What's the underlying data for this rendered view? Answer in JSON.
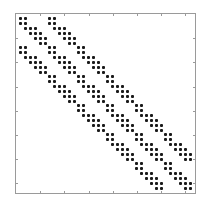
{
  "chart_data": {
    "type": "scatter",
    "subtype": "sparsity-pattern (spy plot)",
    "title": "",
    "xlabel": "",
    "ylabel": "",
    "matrix_size": [
      36,
      36
    ],
    "nnz": 240,
    "xlim": [
      0,
      37
    ],
    "ylim": [
      0,
      37
    ],
    "y_axis_direction": "reversed",
    "tick_step": 5,
    "ticks": [
      5,
      10,
      15,
      20,
      25,
      30,
      35
    ],
    "tick_labels_visible": false,
    "grid": false,
    "legend": null,
    "structure": "block-tridiagonal",
    "block_size": 6,
    "num_blocks": 6,
    "block_pattern_rows": [
      [
        1,
        2
      ],
      [
        1,
        2
      ],
      [
        2,
        3,
        4
      ],
      [
        3,
        4,
        5
      ],
      [
        4,
        5,
        6
      ],
      [
        5,
        6
      ]
    ],
    "blocks": [
      [
        1,
        1
      ],
      [
        1,
        2
      ],
      [
        2,
        1
      ],
      [
        2,
        2
      ],
      [
        2,
        3
      ],
      [
        3,
        2
      ],
      [
        3,
        3
      ],
      [
        3,
        4
      ],
      [
        4,
        3
      ],
      [
        4,
        4
      ],
      [
        4,
        5
      ],
      [
        5,
        4
      ],
      [
        5,
        5
      ],
      [
        5,
        6
      ],
      [
        6,
        5
      ],
      [
        6,
        6
      ]
    ],
    "marker_color": "#1a1a1a",
    "frame_color": "#9a9a9a"
  },
  "frame": {
    "left_px": 15,
    "top_px": 13,
    "size_px": 179
  }
}
